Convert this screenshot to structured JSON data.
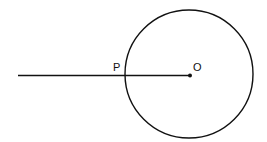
{
  "diagram": {
    "labels": {
      "point_p": "P",
      "point_o": "O"
    },
    "circle": {
      "cx": 190,
      "cy": 74,
      "r": 65,
      "stroke": "#111111"
    },
    "segment": {
      "x1": 18,
      "y1": 75,
      "x2": 190,
      "y2": 75
    },
    "center_dot": {
      "cx": 190,
      "cy": 75,
      "r": 2
    }
  }
}
